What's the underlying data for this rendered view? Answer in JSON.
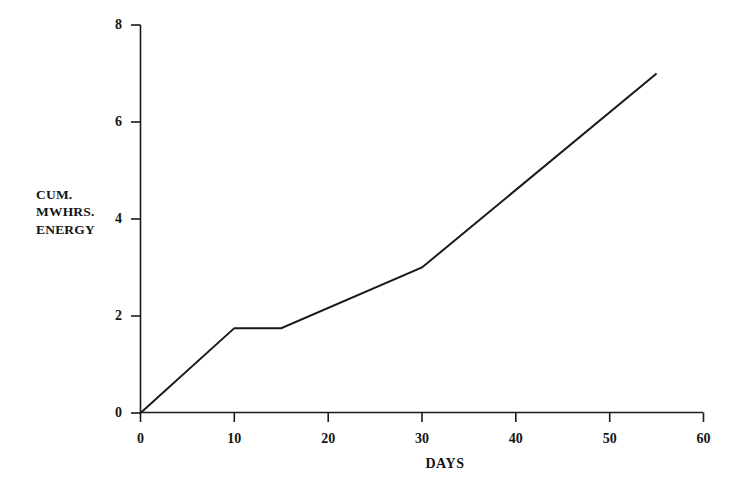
{
  "chart_data": {
    "type": "line",
    "title": "",
    "subtitle": "",
    "xlabel": "DAYS",
    "ylabel": "CUM. MWHRS. ENERGY",
    "ylabel_lines": [
      "CUM.",
      "MWHRS.",
      "ENERGY"
    ],
    "xlim": [
      0,
      60
    ],
    "ylim": [
      0,
      8
    ],
    "xticks": [
      0,
      10,
      20,
      30,
      40,
      50,
      60
    ],
    "xtick_labels": [
      "0",
      "10",
      "20",
      "30",
      "40",
      "50",
      "60"
    ],
    "yticks": [
      0,
      2,
      4,
      6,
      8
    ],
    "ytick_labels": [
      "0",
      "2",
      "4",
      "6",
      "8"
    ],
    "grid": false,
    "legend": false,
    "legend_position": "none",
    "series": [
      {
        "name": "Cumulative energy",
        "color": "#1a1a1a",
        "line_width": 2,
        "markers": false,
        "x": [
          0,
          10,
          15,
          30,
          55
        ],
        "y": [
          0,
          1.75,
          1.75,
          3.0,
          7.0
        ],
        "points": [
          {
            "x": 0,
            "y": 0
          },
          {
            "x": 10,
            "y": 1.75
          },
          {
            "x": 15,
            "y": 1.75
          },
          {
            "x": 30,
            "y": 3.0
          },
          {
            "x": 55,
            "y": 7.0
          }
        ]
      }
    ],
    "annotations": [],
    "axis_color": "#1a1a1a",
    "background_color": "#ffffff"
  },
  "axes": {
    "x_title": "DAYS",
    "y_title_line1": "CUM.",
    "y_title_line2": "MWHRS.",
    "y_title_line3": "ENERGY",
    "x_tick_0": "0",
    "x_tick_1": "10",
    "x_tick_2": "20",
    "x_tick_3": "30",
    "x_tick_4": "40",
    "x_tick_5": "50",
    "x_tick_6": "60",
    "y_tick_0": "0",
    "y_tick_1": "2",
    "y_tick_2": "4",
    "y_tick_3": "6",
    "y_tick_4": "8"
  }
}
